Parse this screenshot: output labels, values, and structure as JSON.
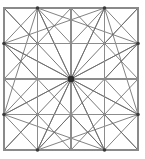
{
  "figure": {
    "title": "Symmetric star polygon grid",
    "type": "line-diagram",
    "canvas": {
      "width": 145,
      "height": 159
    },
    "background_color": "#ffffff",
    "colors": {
      "border": "#8a8a8a",
      "grid": "#8c8c8c",
      "diagonal": "#6b6b6b",
      "star": "#5e5e5e",
      "hub": "#2b2b2b",
      "node": "#3a3a3a"
    },
    "bounds": {
      "left": 4,
      "top": 8,
      "right": 138,
      "bottom": 150
    },
    "grid": {
      "divisions": 4,
      "x_positions": [
        4,
        37.5,
        71,
        104.5,
        138
      ],
      "y_positions": [
        8,
        43.5,
        79,
        114.5,
        150
      ]
    },
    "center": {
      "x": 71,
      "y": 79
    },
    "hub_radius": 3.2,
    "node_radius": 1.8,
    "nodes": [
      {
        "x": 4,
        "y": 8
      },
      {
        "x": 37.5,
        "y": 8
      },
      {
        "x": 71,
        "y": 8
      },
      {
        "x": 104.5,
        "y": 8
      },
      {
        "x": 138,
        "y": 8
      },
      {
        "x": 4,
        "y": 43.5
      },
      {
        "x": 37.5,
        "y": 43.5
      },
      {
        "x": 71,
        "y": 43.5
      },
      {
        "x": 104.5,
        "y": 43.5
      },
      {
        "x": 138,
        "y": 43.5
      },
      {
        "x": 4,
        "y": 79
      },
      {
        "x": 37.5,
        "y": 79
      },
      {
        "x": 104.5,
        "y": 79
      },
      {
        "x": 138,
        "y": 79
      },
      {
        "x": 4,
        "y": 114.5
      },
      {
        "x": 37.5,
        "y": 114.5
      },
      {
        "x": 71,
        "y": 114.5
      },
      {
        "x": 104.5,
        "y": 114.5
      },
      {
        "x": 138,
        "y": 114.5
      },
      {
        "x": 4,
        "y": 150
      },
      {
        "x": 37.5,
        "y": 150
      },
      {
        "x": 71,
        "y": 150
      },
      {
        "x": 104.5,
        "y": 150
      },
      {
        "x": 138,
        "y": 150
      }
    ],
    "emphasized_nodes": [
      {
        "x": 37.5,
        "y": 8
      },
      {
        "x": 104.5,
        "y": 8
      },
      {
        "x": 4,
        "y": 43.5
      },
      {
        "x": 138,
        "y": 43.5
      },
      {
        "x": 4,
        "y": 114.5
      },
      {
        "x": 138,
        "y": 114.5
      },
      {
        "x": 37.5,
        "y": 150
      },
      {
        "x": 104.5,
        "y": 150
      }
    ],
    "border_rect": {
      "x": 4,
      "y": 8,
      "width": 134,
      "height": 142
    },
    "grid_lines": [
      {
        "x1": 37.5,
        "y1": 8,
        "x2": 37.5,
        "y2": 150
      },
      {
        "x1": 71,
        "y1": 8,
        "x2": 71,
        "y2": 150
      },
      {
        "x1": 104.5,
        "y1": 8,
        "x2": 104.5,
        "y2": 150
      },
      {
        "x1": 4,
        "y1": 43.5,
        "x2": 138,
        "y2": 43.5
      },
      {
        "x1": 4,
        "y1": 79,
        "x2": 138,
        "y2": 79
      },
      {
        "x1": 4,
        "y1": 114.5,
        "x2": 138,
        "y2": 114.5
      }
    ],
    "corner_cell_diagonals": [
      {
        "x1": 4,
        "y1": 8,
        "x2": 37.5,
        "y2": 43.5
      },
      {
        "x1": 37.5,
        "y1": 8,
        "x2": 4,
        "y2": 43.5
      },
      {
        "x1": 104.5,
        "y1": 8,
        "x2": 138,
        "y2": 43.5
      },
      {
        "x1": 138,
        "y1": 8,
        "x2": 104.5,
        "y2": 43.5
      },
      {
        "x1": 4,
        "y1": 114.5,
        "x2": 37.5,
        "y2": 150
      },
      {
        "x1": 37.5,
        "y1": 114.5,
        "x2": 4,
        "y2": 150
      },
      {
        "x1": 104.5,
        "y1": 114.5,
        "x2": 138,
        "y2": 150
      },
      {
        "x1": 138,
        "y1": 114.5,
        "x2": 104.5,
        "y2": 150
      }
    ],
    "inner_diagonals": [
      {
        "x1": 37.5,
        "y1": 8,
        "x2": 71,
        "y2": 43.5
      },
      {
        "x1": 71,
        "y1": 8,
        "x2": 37.5,
        "y2": 43.5
      },
      {
        "x1": 71,
        "y1": 8,
        "x2": 104.5,
        "y2": 43.5
      },
      {
        "x1": 104.5,
        "y1": 8,
        "x2": 71,
        "y2": 43.5
      },
      {
        "x1": 37.5,
        "y1": 114.5,
        "x2": 71,
        "y2": 150
      },
      {
        "x1": 71,
        "y1": 114.5,
        "x2": 37.5,
        "y2": 150
      },
      {
        "x1": 71,
        "y1": 114.5,
        "x2": 104.5,
        "y2": 150
      },
      {
        "x1": 104.5,
        "y1": 114.5,
        "x2": 71,
        "y2": 150
      },
      {
        "x1": 4,
        "y1": 43.5,
        "x2": 37.5,
        "y2": 79
      },
      {
        "x1": 4,
        "y1": 79,
        "x2": 37.5,
        "y2": 43.5
      },
      {
        "x1": 4,
        "y1": 79,
        "x2": 37.5,
        "y2": 114.5
      },
      {
        "x1": 4,
        "y1": 114.5,
        "x2": 37.5,
        "y2": 79
      },
      {
        "x1": 138,
        "y1": 43.5,
        "x2": 104.5,
        "y2": 79
      },
      {
        "x1": 138,
        "y1": 79,
        "x2": 104.5,
        "y2": 43.5
      },
      {
        "x1": 138,
        "y1": 79,
        "x2": 104.5,
        "y2": 114.5
      },
      {
        "x1": 138,
        "y1": 114.5,
        "x2": 104.5,
        "y2": 79
      }
    ],
    "long_diagonals": [
      {
        "x1": 37.5,
        "y1": 8,
        "x2": 4,
        "y2": 114.5
      },
      {
        "x1": 37.5,
        "y1": 8,
        "x2": 138,
        "y2": 43.5
      },
      {
        "x1": 104.5,
        "y1": 8,
        "x2": 138,
        "y2": 114.5
      },
      {
        "x1": 104.5,
        "y1": 8,
        "x2": 4,
        "y2": 43.5
      },
      {
        "x1": 4,
        "y1": 43.5,
        "x2": 104.5,
        "y2": 150
      },
      {
        "x1": 138,
        "y1": 43.5,
        "x2": 37.5,
        "y2": 150
      },
      {
        "x1": 4,
        "y1": 114.5,
        "x2": 104.5,
        "y2": 150
      },
      {
        "x1": 138,
        "y1": 114.5,
        "x2": 37.5,
        "y2": 150
      },
      {
        "x1": 37.5,
        "y1": 8,
        "x2": 104.5,
        "y2": 150
      },
      {
        "x1": 104.5,
        "y1": 8,
        "x2": 37.5,
        "y2": 150
      },
      {
        "x1": 4,
        "y1": 43.5,
        "x2": 138,
        "y2": 114.5
      },
      {
        "x1": 138,
        "y1": 43.5,
        "x2": 4,
        "y2": 114.5
      }
    ],
    "star_spokes": [
      {
        "x": 4,
        "y": 8
      },
      {
        "x": 37.5,
        "y": 8
      },
      {
        "x": 71,
        "y": 8
      },
      {
        "x": 104.5,
        "y": 8
      },
      {
        "x": 138,
        "y": 8
      },
      {
        "x": 138,
        "y": 43.5
      },
      {
        "x": 138,
        "y": 79
      },
      {
        "x": 138,
        "y": 114.5
      },
      {
        "x": 138,
        "y": 150
      },
      {
        "x": 104.5,
        "y": 150
      },
      {
        "x": 71,
        "y": 150
      },
      {
        "x": 37.5,
        "y": 150
      },
      {
        "x": 4,
        "y": 150
      },
      {
        "x": 4,
        "y": 114.5
      },
      {
        "x": 4,
        "y": 79
      },
      {
        "x": 4,
        "y": 43.5
      }
    ]
  }
}
